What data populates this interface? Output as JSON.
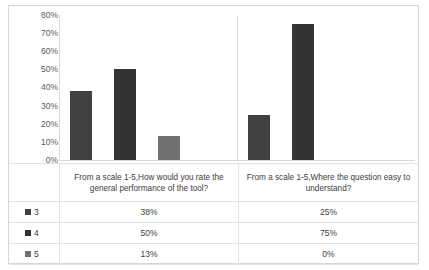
{
  "chart_data": {
    "type": "bar",
    "title": "",
    "subtitle": "",
    "xlabel": "",
    "ylabel": "",
    "ylim": [
      0,
      80
    ],
    "grid": false,
    "legend_position": "table-left",
    "ytick_labels": [
      "80%",
      "70%",
      "60%",
      "50%",
      "40%",
      "30%",
      "20%",
      "10%",
      "0%"
    ],
    "ytick_values": [
      80,
      70,
      60,
      50,
      40,
      30,
      20,
      10,
      0
    ],
    "categories": [
      "From a scale 1-5,How would you rate the general performance of the tool?",
      "From a scale 1-5,Where the question easy to understand?"
    ],
    "series": [
      {
        "name": "3",
        "color": "#404040",
        "values": [
          38,
          25
        ],
        "labels": [
          "38%",
          "25%"
        ]
      },
      {
        "name": "4",
        "color": "#333333",
        "values": [
          50,
          75
        ],
        "labels": [
          "50%",
          "75%"
        ]
      },
      {
        "name": "5",
        "color": "#707070",
        "values": [
          13,
          0
        ],
        "labels": [
          "13%",
          "0%"
        ]
      }
    ]
  },
  "table": {
    "rows": [
      {
        "legend": "3",
        "swatch": "#404040",
        "values": [
          "38%",
          "25%"
        ]
      },
      {
        "legend": "4",
        "swatch": "#333333",
        "values": [
          "50%",
          "75%"
        ]
      },
      {
        "legend": "5",
        "swatch": "#707070",
        "values": [
          "13%",
          "0%"
        ]
      }
    ]
  }
}
